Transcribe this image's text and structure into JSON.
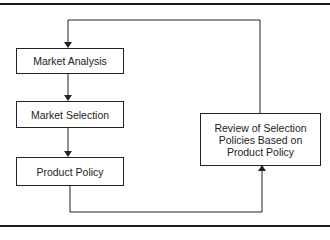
{
  "diagram": {
    "nodes": [
      {
        "id": "market-analysis",
        "label": "Market Analysis"
      },
      {
        "id": "market-selection",
        "label": "Market Selection"
      },
      {
        "id": "product-policy",
        "label": "Product Policy"
      },
      {
        "id": "review",
        "label": "Review of Selection Policies Based on Product Policy"
      }
    ],
    "edges": [
      {
        "from": "market-analysis",
        "to": "market-selection"
      },
      {
        "from": "market-selection",
        "to": "product-policy"
      },
      {
        "from": "product-policy",
        "to": "review"
      },
      {
        "from": "review",
        "to": "market-analysis"
      }
    ],
    "colors": {
      "line": "#222222",
      "background": "#ffffff"
    }
  }
}
